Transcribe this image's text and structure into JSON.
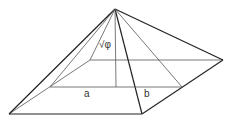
{
  "diagram": {
    "labels": {
      "height_label": "√φ",
      "half_base_label": "a",
      "slant_label": "b"
    },
    "vertices": {
      "apex": [
        115,
        9
      ],
      "front_left": [
        9,
        114
      ],
      "front_right": [
        142,
        114
      ],
      "right": [
        223,
        60
      ],
      "back_left": [
        90,
        60
      ],
      "center": [
        116,
        87
      ],
      "left_mid": [
        50,
        87
      ],
      "right_mid": [
        182,
        87
      ]
    },
    "colors": {
      "stroke": "#222222",
      "light_stroke": "#555555",
      "background": "#ffffff"
    }
  }
}
